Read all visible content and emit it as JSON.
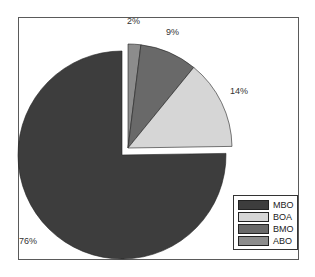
{
  "chart_data": {
    "type": "pie",
    "title": "",
    "categories": [
      "MBO",
      "BOA",
      "BMO",
      "ABO"
    ],
    "values": [
      76,
      14,
      9,
      2
    ],
    "labels": [
      "76%",
      "14%",
      "9%",
      "2%"
    ],
    "colors": [
      "#3d3d3d",
      "#d6d6d6",
      "#696969",
      "#8c8c8c"
    ],
    "exploded": [
      "BOA",
      "BMO",
      "ABO"
    ],
    "legend_position": "bottom-right-inside"
  },
  "legend": {
    "items": [
      {
        "label": "MBO",
        "color": "#3d3d3d"
      },
      {
        "label": "BOA",
        "color": "#d6d6d6"
      },
      {
        "label": "BMO",
        "color": "#696969"
      },
      {
        "label": "ABO",
        "color": "#8c8c8c"
      }
    ]
  },
  "data_labels": {
    "mbo": "76%",
    "boa": "14%",
    "bmo": "9%",
    "abo": "2%"
  }
}
